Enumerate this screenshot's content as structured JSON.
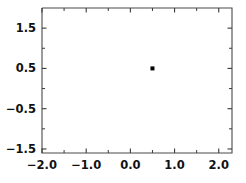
{
  "figure": {
    "title": "",
    "background_color": "#ffffff",
    "foreground_color": "#000000"
  },
  "axes": {
    "frame": {
      "left_px": 42,
      "top_px": 8,
      "right_px": 232,
      "bottom_px": 153
    },
    "x": {
      "label": "",
      "lim": [
        -2.0,
        2.3
      ],
      "major_ticks": [
        -2.0,
        -1.0,
        0.0,
        1.0,
        2.0
      ],
      "major_tick_labels": [
        "-2.0",
        "-1.0",
        "0.0",
        "1.0",
        "2.0"
      ],
      "minor_ticks": [
        -1.5,
        -0.5,
        0.5,
        1.5
      ],
      "tick_direction": "in"
    },
    "y": {
      "label": "",
      "lim": [
        -1.6,
        2.0
      ],
      "major_ticks": [
        1.5,
        0.5,
        -0.5,
        -1.5
      ],
      "major_tick_labels": [
        "1.5",
        "0.5",
        "-0.5",
        "-1.5"
      ],
      "minor_ticks": [
        1.0,
        0.0,
        -1.0
      ],
      "tick_direction": "in"
    },
    "grid": false,
    "legend": null
  },
  "chart_data": {
    "type": "line",
    "title": "",
    "xlabel": "",
    "ylabel": "",
    "xlim": [
      -2.0,
      2.3
    ],
    "ylim": [
      -1.6,
      2.0
    ],
    "grid": false,
    "legend_position": "none",
    "series": [
      {
        "name": "reflected-rays",
        "type": "line-bundle",
        "count": 110,
        "color": "#000000",
        "linewidth": 0.55,
        "generator": {
          "kind": "circle-reflection-caustic",
          "circle_center": [
            0.0,
            0.05
          ],
          "circle_radius": 1.0,
          "source_point": [
            0.5,
            0.5
          ],
          "theta_start_deg": 0,
          "theta_end_deg": 360,
          "ray_extension": 1.05
        }
      }
    ],
    "annotations": [
      {
        "name": "source-point-marker",
        "marker": "square",
        "x": 0.5,
        "y": 0.5,
        "size_px": 4,
        "color": "#000000"
      }
    ]
  }
}
